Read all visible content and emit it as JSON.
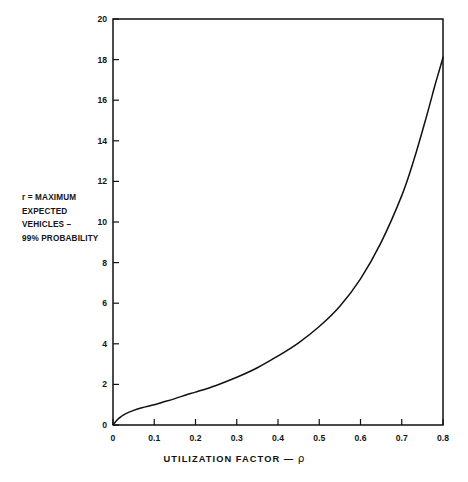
{
  "figure": {
    "annotation": "r = MAXIMUM\nEXPECTED\nVEHICLES –\n99% PROBABILITY",
    "axis_title_text": "UTILIZATION FACTOR —",
    "axis_title_symbol": "ρ",
    "ink_color": "#111111",
    "background_color": "#ffffff"
  },
  "chart_data": {
    "type": "line",
    "title": "",
    "subtitle": "",
    "xlabel": "UTILIZATION FACTOR — ρ",
    "ylabel": "r = MAXIMUM EXPECTED VEHICLES – 99% PROBABILITY",
    "xlim": [
      0,
      0.8
    ],
    "ylim": [
      0,
      20
    ],
    "grid": false,
    "legend": false,
    "legend_position": "none",
    "x_ticks": [
      0,
      0.1,
      0.2,
      0.3,
      0.4,
      0.5,
      0.6,
      0.7,
      0.8
    ],
    "x_tick_labels": [
      "0",
      "0.1",
      "0.2",
      "0.3",
      "0.4",
      "0.5",
      "0.6",
      "0.7",
      "0.8"
    ],
    "y_ticks": [
      0,
      2,
      4,
      6,
      8,
      10,
      12,
      14,
      16,
      18,
      20
    ],
    "y_tick_labels": [
      "0",
      "2",
      "4",
      "6",
      "8",
      "10",
      "12",
      "14",
      "16",
      "18",
      "20"
    ],
    "series": [
      {
        "name": "maximum expected vehicles",
        "x": [
          0.0,
          0.01,
          0.02,
          0.03,
          0.05,
          0.07,
          0.09,
          0.1,
          0.12,
          0.15,
          0.18,
          0.2,
          0.25,
          0.3,
          0.35,
          0.4,
          0.45,
          0.5,
          0.55,
          0.6,
          0.65,
          0.7,
          0.73,
          0.76,
          0.78,
          0.79,
          0.8
        ],
        "y": [
          0.0,
          0.25,
          0.42,
          0.55,
          0.72,
          0.85,
          0.95,
          1.0,
          1.12,
          1.3,
          1.5,
          1.62,
          1.95,
          2.35,
          2.82,
          3.4,
          4.05,
          4.85,
          5.85,
          7.2,
          9.0,
          11.3,
          13.1,
          15.2,
          16.7,
          17.4,
          18.1
        ]
      }
    ]
  }
}
